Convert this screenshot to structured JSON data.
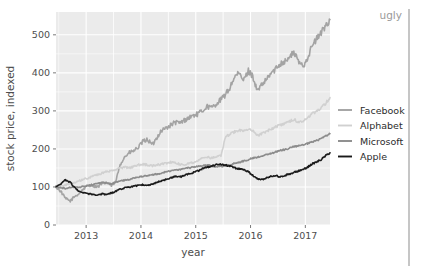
{
  "annotation": {
    "text": "ugly"
  },
  "chart_data": {
    "type": "line",
    "title": "",
    "xlabel": "year",
    "ylabel": "stock price, indexed",
    "xlim": [
      2012.45,
      2017.45
    ],
    "ylim": [
      0,
      560
    ],
    "xticks": [
      2013,
      2014,
      2015,
      2016,
      2017
    ],
    "xticklabels": [
      "2013",
      "2014",
      "2015",
      "2016",
      "2017"
    ],
    "yticks": [
      0,
      100,
      200,
      300,
      400,
      500
    ],
    "yticklabels": [
      "0",
      "100",
      "200",
      "300",
      "400",
      "500"
    ],
    "grid": true,
    "grid_color": "#ffffff",
    "panel_background": "#ebebeb",
    "legend_position": "right",
    "series": [
      {
        "name": "Facebook",
        "color": "#a3a3a3",
        "x": [
          2012.45,
          2012.54,
          2012.62,
          2012.71,
          2012.79,
          2012.87,
          2012.96,
          2013.04,
          2013.12,
          2013.21,
          2013.29,
          2013.37,
          2013.46,
          2013.54,
          2013.62,
          2013.71,
          2013.79,
          2013.87,
          2013.96,
          2014.04,
          2014.12,
          2014.21,
          2014.29,
          2014.37,
          2014.46,
          2014.54,
          2014.62,
          2014.71,
          2014.79,
          2014.87,
          2014.96,
          2015.04,
          2015.12,
          2015.21,
          2015.29,
          2015.37,
          2015.46,
          2015.54,
          2015.62,
          2015.71,
          2015.79,
          2015.87,
          2015.96,
          2016.04,
          2016.12,
          2016.21,
          2016.29,
          2016.37,
          2016.46,
          2016.54,
          2016.62,
          2016.71,
          2016.79,
          2016.87,
          2016.96,
          2017.04,
          2017.12,
          2017.21,
          2017.29,
          2017.37,
          2017.45
        ],
        "y": [
          100,
          88,
          70,
          63,
          75,
          82,
          96,
          105,
          104,
          100,
          108,
          112,
          104,
          113,
          160,
          180,
          190,
          195,
          205,
          220,
          225,
          210,
          230,
          248,
          255,
          262,
          270,
          268,
          275,
          282,
          288,
          292,
          300,
          312,
          308,
          318,
          330,
          342,
          360,
          390,
          398,
          380,
          405,
          392,
          352,
          368,
          382,
          398,
          410,
          425,
          430,
          440,
          455,
          430,
          418,
          440,
          470,
          490,
          505,
          525,
          540
        ]
      },
      {
        "name": "Alphabet",
        "color": "#d0d0d0",
        "x": [
          2012.45,
          2012.54,
          2012.62,
          2012.71,
          2012.79,
          2012.87,
          2012.96,
          2013.04,
          2013.12,
          2013.21,
          2013.29,
          2013.37,
          2013.46,
          2013.54,
          2013.62,
          2013.71,
          2013.79,
          2013.87,
          2013.96,
          2014.04,
          2014.12,
          2014.21,
          2014.29,
          2014.37,
          2014.46,
          2014.54,
          2014.62,
          2014.71,
          2014.79,
          2014.87,
          2014.96,
          2015.04,
          2015.12,
          2015.21,
          2015.29,
          2015.37,
          2015.46,
          2015.54,
          2015.62,
          2015.71,
          2015.79,
          2015.87,
          2015.96,
          2016.04,
          2016.12,
          2016.21,
          2016.29,
          2016.37,
          2016.46,
          2016.54,
          2016.62,
          2016.71,
          2016.79,
          2016.87,
          2016.96,
          2017.04,
          2017.12,
          2017.21,
          2017.29,
          2017.37,
          2017.45
        ],
        "y": [
          100,
          102,
          105,
          108,
          112,
          116,
          120,
          124,
          128,
          132,
          136,
          140,
          142,
          146,
          150,
          152,
          150,
          154,
          158,
          160,
          158,
          155,
          158,
          160,
          162,
          165,
          163,
          160,
          158,
          162,
          165,
          170,
          175,
          178,
          176,
          178,
          182,
          230,
          238,
          245,
          250,
          248,
          252,
          248,
          235,
          240,
          246,
          252,
          258,
          262,
          268,
          272,
          278,
          270,
          272,
          282,
          292,
          300,
          308,
          320,
          335
        ]
      },
      {
        "name": "Microsoft",
        "color": "#8c8c8c",
        "x": [
          2012.45,
          2012.54,
          2012.62,
          2012.71,
          2012.79,
          2012.87,
          2012.96,
          2013.04,
          2013.12,
          2013.21,
          2013.29,
          2013.37,
          2013.46,
          2013.54,
          2013.62,
          2013.71,
          2013.79,
          2013.87,
          2013.96,
          2014.04,
          2014.12,
          2014.21,
          2014.29,
          2014.37,
          2014.46,
          2014.54,
          2014.62,
          2014.71,
          2014.79,
          2014.87,
          2014.96,
          2015.04,
          2015.12,
          2015.21,
          2015.29,
          2015.37,
          2015.46,
          2015.54,
          2015.62,
          2015.71,
          2015.79,
          2015.87,
          2015.96,
          2016.04,
          2016.12,
          2016.21,
          2016.29,
          2016.37,
          2016.46,
          2016.54,
          2016.62,
          2016.71,
          2016.79,
          2016.87,
          2016.96,
          2017.04,
          2017.12,
          2017.21,
          2017.29,
          2017.37,
          2017.45
        ],
        "y": [
          100,
          98,
          96,
          99,
          100,
          98,
          102,
          104,
          106,
          110,
          112,
          110,
          108,
          112,
          116,
          118,
          120,
          124,
          126,
          128,
          130,
          132,
          134,
          136,
          140,
          142,
          144,
          146,
          148,
          150,
          152,
          155,
          156,
          158,
          155,
          152,
          154,
          156,
          158,
          162,
          165,
          168,
          172,
          176,
          178,
          182,
          185,
          188,
          192,
          196,
          198,
          202,
          206,
          208,
          210,
          214,
          218,
          222,
          228,
          234,
          240
        ]
      },
      {
        "name": "Apple",
        "color": "#1a1a1a",
        "x": [
          2012.45,
          2012.54,
          2012.62,
          2012.71,
          2012.79,
          2012.87,
          2012.96,
          2013.04,
          2013.12,
          2013.21,
          2013.29,
          2013.37,
          2013.46,
          2013.54,
          2013.62,
          2013.71,
          2013.79,
          2013.87,
          2013.96,
          2014.04,
          2014.12,
          2014.21,
          2014.29,
          2014.37,
          2014.46,
          2014.54,
          2014.62,
          2014.71,
          2014.79,
          2014.87,
          2014.96,
          2015.04,
          2015.12,
          2015.21,
          2015.29,
          2015.37,
          2015.46,
          2015.54,
          2015.62,
          2015.71,
          2015.79,
          2015.87,
          2015.96,
          2016.04,
          2016.12,
          2016.21,
          2016.29,
          2016.37,
          2016.46,
          2016.54,
          2016.62,
          2016.71,
          2016.79,
          2016.87,
          2016.96,
          2017.04,
          2017.12,
          2017.21,
          2017.29,
          2017.37,
          2017.45
        ],
        "y": [
          100,
          108,
          118,
          112,
          98,
          88,
          84,
          82,
          80,
          78,
          82,
          80,
          84,
          88,
          94,
          98,
          100,
          102,
          104,
          106,
          104,
          108,
          112,
          116,
          120,
          124,
          128,
          126,
          130,
          134,
          138,
          142,
          148,
          152,
          155,
          158,
          160,
          158,
          155,
          150,
          148,
          145,
          140,
          130,
          122,
          120,
          124,
          128,
          130,
          126,
          130,
          134,
          138,
          142,
          146,
          152,
          160,
          166,
          172,
          182,
          190
        ]
      }
    ]
  }
}
